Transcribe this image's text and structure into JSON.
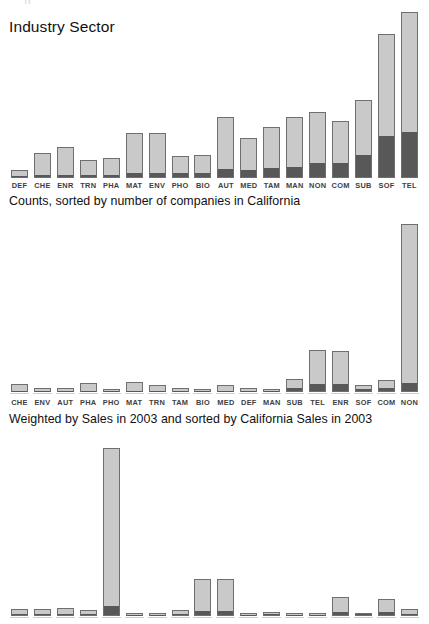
{
  "top_partial_text": "                                   ,                      g",
  "charts": [
    {
      "title": "Industry Sector",
      "caption": "Counts, sorted by number of companies in California",
      "show_labels": true,
      "chart_data": {
        "type": "bar",
        "title": "Industry Sector",
        "subtitle": "Counts, sorted by number of companies in California",
        "xlabel": "",
        "ylabel": "",
        "stacked": true,
        "grid": false,
        "legend": "none",
        "ylim": [
          0,
          100
        ],
        "categories": [
          "DEF",
          "CHE",
          "ENR",
          "TRN",
          "PHA",
          "MAT",
          "ENV",
          "PHO",
          "BIO",
          "AUT",
          "MED",
          "TAM",
          "MAN",
          "NON",
          "COM",
          "SUB",
          "SOF",
          "TEL"
        ],
        "series": [
          {
            "name": "California",
            "color": "#585858",
            "values": [
              0.5,
              1.5,
              1.5,
              1.0,
              1.5,
              2.5,
              2.5,
              2.5,
              2.5,
              5.0,
              4.0,
              5.5,
              6.0,
              8.5,
              8.5,
              13.0,
              25.0,
              27.0
            ]
          },
          {
            "name": "Rest",
            "color": "#c9c9c9",
            "values": [
              4.5,
              13.5,
              17.0,
              10.0,
              10.5,
              24.5,
              24.5,
              10.5,
              11.5,
              32.0,
              20.0,
              25.5,
              31.0,
              31.5,
              26.0,
              34.0,
              62.0,
              73.0
            ]
          }
        ],
        "totals": [
          5,
          15,
          18.5,
          11,
          12,
          27,
          27,
          13,
          14,
          37,
          24,
          31,
          37,
          40,
          34.5,
          47,
          87,
          100
        ]
      }
    },
    {
      "title": "",
      "caption": "Weighted by Sales in 2003 and sorted by California Sales in 2003",
      "show_labels": true,
      "chart_data": {
        "type": "bar",
        "title": "",
        "subtitle": "Weighted by Sales in 2003 and sorted by California Sales in 2003",
        "xlabel": "",
        "ylabel": "",
        "stacked": true,
        "grid": false,
        "legend": "none",
        "ylim": [
          0,
          100
        ],
        "categories": [
          "CHE",
          "ENV",
          "AUT",
          "PHA",
          "PHO",
          "MAT",
          "TRN",
          "TAM",
          "BIO",
          "MED",
          "DEF",
          "MAN",
          "SUB",
          "TEL",
          "ENR",
          "SOF",
          "COM",
          "NON"
        ],
        "series": [
          {
            "name": "California",
            "color": "#585858",
            "values": [
              0.3,
              0.2,
              0.2,
              0.3,
              0.2,
              0.3,
              0.3,
              0.2,
              0.2,
              0.3,
              0.2,
              0.2,
              1.5,
              4.0,
              4.0,
              1.2,
              1.6,
              5.0
            ]
          },
          {
            "name": "Rest",
            "color": "#c9c9c9",
            "values": [
              4.7,
              2.0,
              2.2,
              5.0,
              0.8,
              5.4,
              4.0,
              2.2,
              1.6,
              4.0,
              2.4,
              1.6,
              6.0,
              21.0,
              20.0,
              3.2,
              5.4,
              95.0
            ]
          }
        ],
        "totals": [
          5,
          2.2,
          2.4,
          5.3,
          1,
          5.7,
          4.3,
          2.4,
          1.8,
          4.3,
          2.6,
          1.8,
          7.5,
          25,
          24,
          4.4,
          7,
          100
        ]
      }
    },
    {
      "title": "",
      "caption": "",
      "show_labels": false,
      "chart_data": {
        "type": "bar",
        "title": "",
        "subtitle": "",
        "xlabel": "",
        "ylabel": "",
        "stacked": true,
        "grid": false,
        "legend": "none",
        "note": "axis labels are cut off at the bottom edge of the screenshot",
        "ylim": [
          0,
          100
        ],
        "categories": [
          "",
          "",
          "",
          "",
          "",
          "",
          "",
          "",
          "",
          "",
          "",
          "",
          "",
          "",
          "",
          "",
          "",
          ""
        ],
        "series": [
          {
            "name": "California",
            "color": "#585858",
            "values": [
              0.4,
              0.4,
              0.5,
              0.4,
              5.5,
              0.3,
              0.3,
              0.4,
              2.5,
              2.5,
              0.3,
              0.4,
              0.3,
              0.2,
              1.8,
              0.4,
              1.6,
              0.5
            ]
          },
          {
            "name": "Rest",
            "color": "#c9c9c9",
            "values": [
              3.6,
              3.6,
              4.5,
              3.1,
              94.5,
              1.2,
              1.2,
              3.1,
              19.5,
              19.5,
              1.2,
              2.1,
              1.2,
              0.6,
              9.2,
              1.6,
              8.4,
              3.5
            ]
          }
        ],
        "totals": [
          4,
          4,
          5,
          3.5,
          100,
          1.5,
          1.5,
          3.5,
          22,
          22,
          1.5,
          2.5,
          1.5,
          0.8,
          11,
          2,
          10,
          4
        ]
      }
    }
  ]
}
